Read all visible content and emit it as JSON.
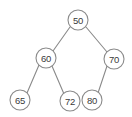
{
  "diagram": {
    "kind": "binary-search-tree",
    "background_color": "#ffffff",
    "node_stroke_color": "#8a8a8a",
    "node_fill_color": "#ffffff",
    "edge_color": "#8a8a8a",
    "label_color": "#3a3a3a",
    "node_radius": 10,
    "nodes": [
      {
        "id": "n50",
        "label": "50",
        "cx": 78,
        "cy": 20,
        "level": 0,
        "role": "root"
      },
      {
        "id": "n60",
        "label": "60",
        "cx": 46,
        "cy": 58,
        "level": 1,
        "role": "left-child"
      },
      {
        "id": "n70",
        "label": "70",
        "cx": 114,
        "cy": 59,
        "level": 1,
        "role": "right-child"
      },
      {
        "id": "n65",
        "label": "65",
        "cx": 20,
        "cy": 100,
        "level": 2,
        "role": "left-leaf"
      },
      {
        "id": "n72",
        "label": "72",
        "cx": 70,
        "cy": 101,
        "level": 2,
        "role": "right-leaf"
      },
      {
        "id": "n80",
        "label": "80",
        "cx": 92,
        "cy": 100,
        "level": 2,
        "role": "left-leaf"
      }
    ],
    "edges": [
      {
        "id": "e50-60",
        "from": "n50",
        "to": "n60",
        "x1": 70,
        "y1": 27,
        "x2": 53,
        "y2": 51
      },
      {
        "id": "e50-70",
        "from": "n50",
        "to": "n70",
        "x1": 86,
        "y1": 27,
        "x2": 107,
        "y2": 52
      },
      {
        "id": "e60-65",
        "from": "n60",
        "to": "n65",
        "x1": 39,
        "y1": 65,
        "x2": 27,
        "y2": 93
      },
      {
        "id": "e60-72",
        "from": "n60",
        "to": "n72",
        "x1": 52,
        "y1": 66,
        "x2": 64,
        "y2": 94
      },
      {
        "id": "e70-80",
        "from": "n70",
        "to": "n80",
        "x1": 107,
        "y1": 66,
        "x2": 98,
        "y2": 93
      }
    ]
  }
}
